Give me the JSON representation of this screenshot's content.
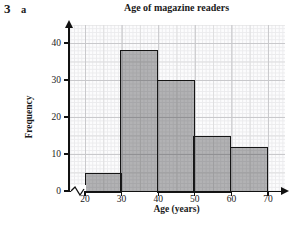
{
  "exercise": {
    "number": "3",
    "part": "a"
  },
  "chart_data": {
    "type": "bar",
    "subtype": "histogram",
    "title": "Age of magazine readers",
    "xlabel": "Age (years)",
    "ylabel": "Frequency",
    "categories": [
      "20-30",
      "30-40",
      "40-50",
      "50-60",
      "60-70"
    ],
    "values": [
      5,
      38,
      30,
      15,
      12
    ],
    "bins": [
      {
        "start": 20,
        "end": 30,
        "frequency": 5
      },
      {
        "start": 30,
        "end": 40,
        "frequency": 38
      },
      {
        "start": 40,
        "end": 50,
        "frequency": 30
      },
      {
        "start": 50,
        "end": 60,
        "frequency": 15
      },
      {
        "start": 60,
        "end": 70,
        "frequency": 12
      }
    ],
    "x_ticks": [
      20,
      30,
      40,
      50,
      60,
      70
    ],
    "y_ticks": [
      0,
      10,
      20,
      30,
      40
    ],
    "xlim": [
      20,
      70
    ],
    "ylim": [
      0,
      44
    ],
    "grid": "fine graph paper, major lines every 10 units",
    "axis_break_before_first_x_tick": true,
    "legend": "none"
  },
  "colors": {
    "bar_fill": "#b5b5b7",
    "bar_border": "#151515",
    "axis": "#111111",
    "grid_minor": "#ebebed",
    "grid_mid": "#dededf",
    "grid_major": "#c9c9cc",
    "text": "#1a1a1a",
    "background": "#ffffff"
  }
}
